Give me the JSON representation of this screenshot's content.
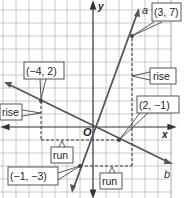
{
  "diagram": {
    "type": "coordinate_plane_slope",
    "grid": {
      "x_range": [
        -7,
        6
      ],
      "y_range": [
        -5,
        9
      ],
      "step": 1
    },
    "axes": {
      "x_label": "x",
      "y_label": "y",
      "origin_label": "O"
    },
    "lines": [
      {
        "name": "a",
        "points": [
          {
            "label": "(−1, −3)",
            "x": -1,
            "y": -3
          },
          {
            "label": "(3, 7)",
            "x": 3,
            "y": 7
          }
        ],
        "rise_label": "rise",
        "run_label": "run"
      },
      {
        "name": "b",
        "points": [
          {
            "label": "(−4, 2)",
            "x": -4,
            "y": 2
          },
          {
            "label": "(2, −1)",
            "x": 2,
            "y": -1
          }
        ],
        "rise_label": "rise",
        "run_label": "run"
      }
    ],
    "colors": {
      "grid": "#b8b8b8",
      "axis": "#333333",
      "line": "#555555",
      "dash": "#333333",
      "label_border": "#444444"
    }
  }
}
